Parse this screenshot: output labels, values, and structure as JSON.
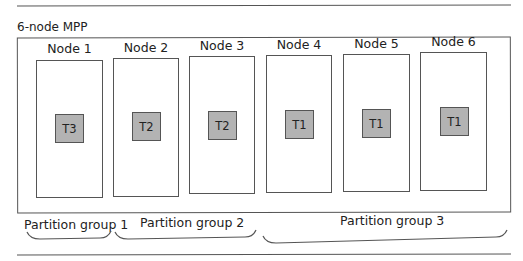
{
  "diagram": {
    "title": "6-node MPP",
    "nodes": [
      {
        "label": "Node 1",
        "task": "T3"
      },
      {
        "label": "Node 2",
        "task": "T2"
      },
      {
        "label": "Node 3",
        "task": "T2"
      },
      {
        "label": "Node 4",
        "task": "T1"
      },
      {
        "label": "Node 5",
        "task": "T1"
      },
      {
        "label": "Node 6",
        "task": "T1"
      }
    ],
    "partition_groups": [
      {
        "label": "Partition group 1",
        "nodes": [
          "Node 1"
        ]
      },
      {
        "label": "Partition group 2",
        "nodes": [
          "Node 2",
          "Node 3"
        ]
      },
      {
        "label": "Partition group 3",
        "nodes": [
          "Node 4",
          "Node 5",
          "Node 6"
        ]
      }
    ],
    "colors": {
      "line": "#555555",
      "task_fill": "#b3b3b3",
      "background": "#ffffff"
    }
  }
}
